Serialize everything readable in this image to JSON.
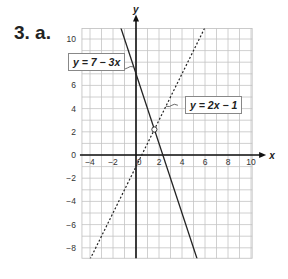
{
  "question_label": "3. a.",
  "chart_data": {
    "type": "line",
    "title": "",
    "xlabel": "x",
    "ylabel": "y",
    "xlim": [
      -5,
      10
    ],
    "ylim": [
      -9,
      11
    ],
    "grid": true,
    "x_ticks": [
      -4,
      -2,
      0,
      2,
      4,
      6,
      8,
      10
    ],
    "y_ticks": [
      -8,
      -6,
      -4,
      -2,
      0,
      2,
      4,
      6,
      8,
      10
    ],
    "series": [
      {
        "name": "y = 7 − 3x",
        "style": "solid",
        "x": [
          -1.33,
          5.33
        ],
        "y": [
          11,
          -9
        ]
      },
      {
        "name": "y = 2x − 1",
        "style": "dotted",
        "x": [
          -4,
          6
        ],
        "y": [
          -9,
          11
        ]
      }
    ],
    "annotations": [
      {
        "text": "y = 7 − 3x",
        "points_to": "solid line"
      },
      {
        "text": "y = 2x − 1",
        "points_to": "dotted line"
      },
      {
        "text": "intersection",
        "x": 1.6,
        "y": 2.2,
        "marker": "circle"
      }
    ]
  }
}
